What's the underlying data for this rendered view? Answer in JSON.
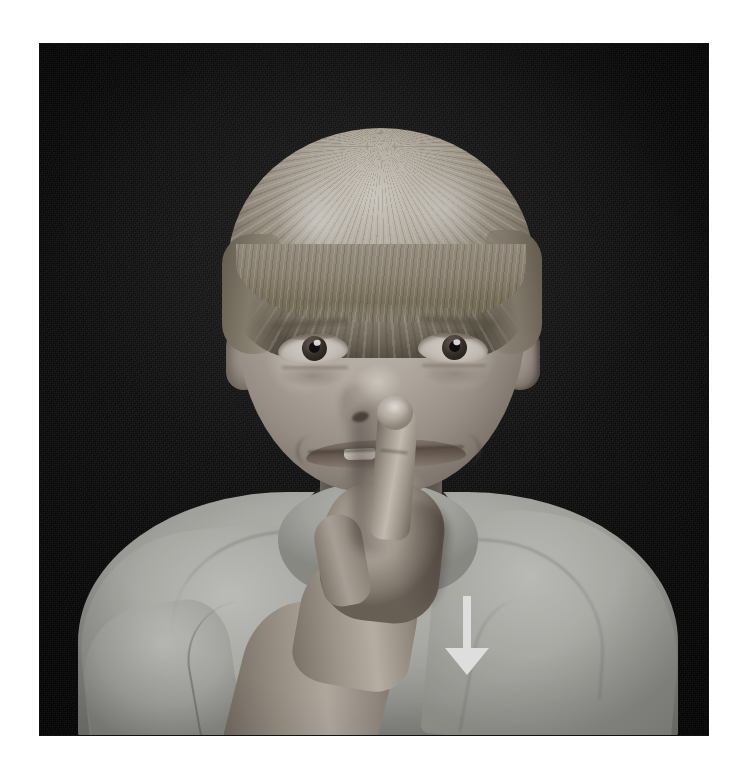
{
  "page": {
    "background_color": "#ffffff",
    "width": 738,
    "height": 774
  },
  "photo": {
    "name": "asl-sign-photograph",
    "alt_text": "Black and white photograph of a young blond child holding an index finger vertically against the lips, with a white arrow pointing downward overlaid on the chest area.",
    "colors": {
      "backdrop": "#0b0b0b",
      "skin_highlight": "#ded5c8",
      "skin_midtone": "#b0a699",
      "skin_shadow": "#7a7064",
      "hair_highlight": "#e6e0d5",
      "hair_midtone": "#a79d8d",
      "hair_shadow": "#5f5749",
      "shirt_light": "#d4d4d0",
      "shirt_mid": "#c1c1bc",
      "shirt_shadow": "#a3a39e",
      "arrow": "#ffffff"
    },
    "frame": {
      "left": 40,
      "top": 44,
      "width": 668,
      "height": 691
    }
  },
  "subject": {
    "description": "young child",
    "hair_style": "blond bowl cut with straight bangs",
    "expression": "slight smile, eyes open looking at camera",
    "garment": "light gray crew-neck sweatshirt",
    "gesture": "index finger of right hand pressed vertically against the lips"
  },
  "overlay": {
    "arrow": {
      "name": "downward-motion-arrow",
      "direction": "down",
      "color": "#ffffff",
      "shaft_width": 8,
      "head_width": 46,
      "position": {
        "left": 397,
        "top": 552,
        "width": 60,
        "height": 80
      }
    }
  }
}
